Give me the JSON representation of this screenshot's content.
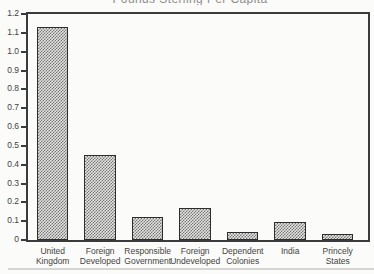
{
  "chart_data": {
    "type": "bar",
    "title": "Pounds Sterling Per Capita",
    "title_clipped_at_top": true,
    "categories": [
      "United Kingdom",
      "Foreign Developed",
      "Responsible Government",
      "Foreign Undeveloped",
      "Dependent Colonies",
      "India",
      "Princely States"
    ],
    "values": [
      1.13,
      0.45,
      0.12,
      0.17,
      0.045,
      0.095,
      0.03
    ],
    "xlabel": "",
    "ylabel": "",
    "ylim": [
      0,
      1.2
    ],
    "ytick_interval": 0.1,
    "ytick_labels": [
      "0",
      "0.1",
      "0.2",
      "0.3",
      "0.4",
      "0.5",
      "0.6",
      "0.7",
      "0.8",
      "0.9",
      "1.0",
      "1.1",
      "1.2"
    ],
    "grid": false,
    "legend": "none",
    "bar_fill_style": "gray-dither-hatch"
  },
  "colors": {
    "background": "#fbfbf9",
    "axis": "#3b3b3b",
    "tick_text": "#434343",
    "title_text": "#8e8e8e",
    "bar_dot": "#767676",
    "bar_bg": "#e2e2e0",
    "bar_border": "#2d2d2d",
    "bottom_rule": "#d6d6d4"
  }
}
